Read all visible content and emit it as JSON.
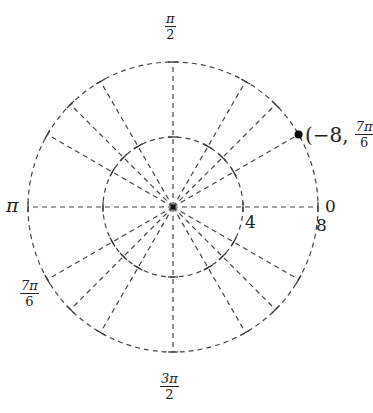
{
  "diagram": {
    "type": "polar-grid",
    "center": {
      "x": 173,
      "y": 207
    },
    "circles": [
      {
        "r_value": 4,
        "r_px": 70,
        "label": "4"
      },
      {
        "r_value": 8,
        "r_px": 145,
        "label": "8"
      }
    ],
    "ray_angles_deg": [
      0,
      30,
      45,
      60,
      90,
      120,
      135,
      150,
      180,
      210,
      225,
      240,
      270,
      300,
      315,
      330
    ],
    "angle_labels": {
      "zero": "0",
      "half_pi": {
        "num": "π",
        "den": "2"
      },
      "pi": "π",
      "three_half_pi": {
        "num": "3π",
        "den": "2"
      },
      "seven_pi_six": {
        "num": "7π",
        "den": "6"
      }
    },
    "point": {
      "label_prefix": "(−8,",
      "label_angle": {
        "num": "7π",
        "den": "6"
      },
      "r": -8,
      "theta": "7π/6",
      "plotted_angle_deg": 30,
      "color": "#000000"
    },
    "colors": {
      "grid": "#444444",
      "text": "#222222"
    }
  }
}
